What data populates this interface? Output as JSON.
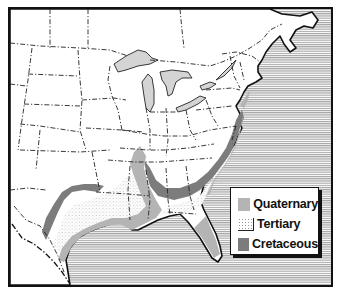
{
  "map": {
    "subject": "Eastern United States coastal plain geology",
    "colors": {
      "ocean_hatch": "#8a8a8a",
      "land": "#ffffff",
      "lakes": "#d4d4d4",
      "quaternary": "#b4b4b4",
      "tertiary_stipple": "#999999",
      "cretaceous": "#7c7c7c",
      "border": "#111111"
    }
  },
  "legend": {
    "items": [
      {
        "label": "Quaternary",
        "swatch": "light-gray"
      },
      {
        "label": "Tertiary",
        "swatch": "stippled-white"
      },
      {
        "label": "Cretaceous",
        "swatch": "dark-gray"
      }
    ]
  }
}
